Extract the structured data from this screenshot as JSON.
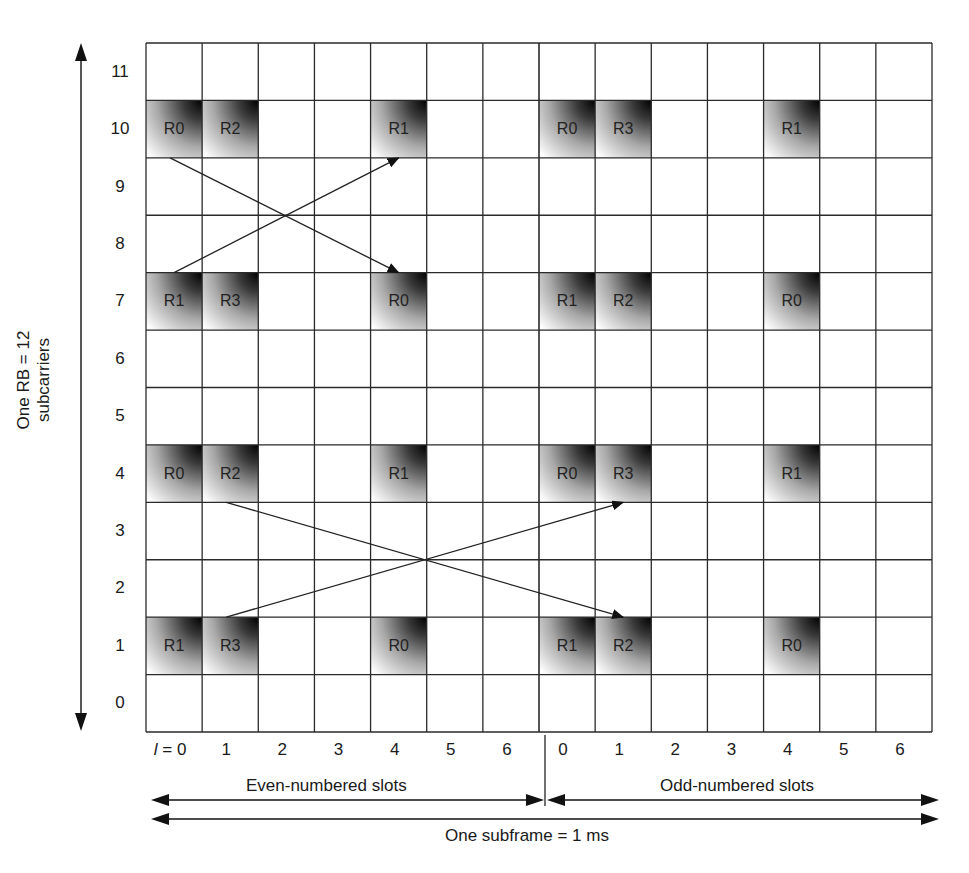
{
  "diagram": {
    "type": "LTE reference signal resource grid",
    "rows": 12,
    "columns_per_slot": 7,
    "slots": 2,
    "y_axis": {
      "title_line1": "One RB = 12",
      "title_line2": "subcarriers",
      "ticks": [
        "0",
        "1",
        "2",
        "3",
        "4",
        "5",
        "6",
        "7",
        "8",
        "9",
        "10",
        "11"
      ]
    },
    "x_axis": {
      "first_prefix": "l = ",
      "even_ticks": [
        "0",
        "1",
        "2",
        "3",
        "4",
        "5",
        "6"
      ],
      "odd_ticks": [
        "0",
        "1",
        "2",
        "3",
        "4",
        "5",
        "6"
      ],
      "even_label": "Even-numbered slots",
      "odd_label": "Odd-numbered slots",
      "subframe_label": "One subframe = 1 ms"
    },
    "reference_cells": [
      {
        "row": 10,
        "col": 0,
        "label": "R0"
      },
      {
        "row": 10,
        "col": 1,
        "label": "R2"
      },
      {
        "row": 10,
        "col": 4,
        "label": "R1"
      },
      {
        "row": 10,
        "col": 7,
        "label": "R0"
      },
      {
        "row": 10,
        "col": 8,
        "label": "R3"
      },
      {
        "row": 10,
        "col": 11,
        "label": "R1"
      },
      {
        "row": 7,
        "col": 0,
        "label": "R1"
      },
      {
        "row": 7,
        "col": 1,
        "label": "R3"
      },
      {
        "row": 7,
        "col": 4,
        "label": "R0"
      },
      {
        "row": 7,
        "col": 7,
        "label": "R1"
      },
      {
        "row": 7,
        "col": 8,
        "label": "R2"
      },
      {
        "row": 7,
        "col": 11,
        "label": "R0"
      },
      {
        "row": 4,
        "col": 0,
        "label": "R0"
      },
      {
        "row": 4,
        "col": 1,
        "label": "R2"
      },
      {
        "row": 4,
        "col": 4,
        "label": "R1"
      },
      {
        "row": 4,
        "col": 7,
        "label": "R0"
      },
      {
        "row": 4,
        "col": 8,
        "label": "R3"
      },
      {
        "row": 4,
        "col": 11,
        "label": "R1"
      },
      {
        "row": 1,
        "col": 0,
        "label": "R1"
      },
      {
        "row": 1,
        "col": 1,
        "label": "R3"
      },
      {
        "row": 1,
        "col": 4,
        "label": "R0"
      },
      {
        "row": 1,
        "col": 7,
        "label": "R1"
      },
      {
        "row": 1,
        "col": 8,
        "label": "R2"
      },
      {
        "row": 1,
        "col": 11,
        "label": "R0"
      }
    ],
    "arrows": [
      {
        "from": "R0 (l=0, sc=10)",
        "to": "R0 (l=4, sc=7)"
      },
      {
        "from": "R1 (l=0, sc=7)",
        "to": "R1 (l=4, sc=10)"
      },
      {
        "from": "R2 (l=1, sc=4)",
        "to": "R2 (odd l=1, sc=1)"
      },
      {
        "from": "R3 (l=1, sc=1)",
        "to": "R3 (odd l=1, sc=4)"
      }
    ],
    "colors": {
      "grid_line": "#2a2a2a",
      "cell_dark": "#000000",
      "cell_light": "#ffffff",
      "text": "#1a1a1a"
    }
  }
}
